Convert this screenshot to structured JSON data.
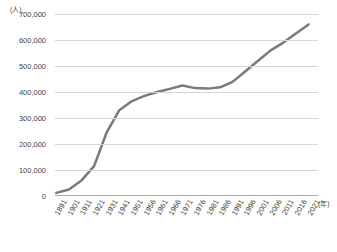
{
  "chart_data": {
    "type": "line",
    "title": "",
    "xlabel": "(年)",
    "ylabel": "(人)",
    "ylim": [
      0,
      700000
    ],
    "ytick_labels": [
      "700,000",
      "600,000",
      "500,000",
      "400,000",
      "300,000",
      "200,000",
      "100,000",
      "0"
    ],
    "ytick_values": [
      700000,
      600000,
      500000,
      400000,
      300000,
      200000,
      100000,
      0
    ],
    "grid": true,
    "legend": "none",
    "line_color": "#7a7a78",
    "line_width": 2.5,
    "categories": [
      "1891",
      "1901",
      "1911",
      "1921",
      "1931",
      "1941",
      "1951",
      "1956",
      "1961",
      "1966",
      "1971",
      "1976",
      "1981",
      "1986",
      "1991",
      "1996",
      "2001",
      "2006",
      "2011",
      "2016",
      "2021"
    ],
    "values": [
      12000,
      25000,
      60000,
      115000,
      245000,
      330000,
      365000,
      385000,
      400000,
      412000,
      425000,
      415000,
      413000,
      418000,
      440000,
      480000,
      520000,
      560000,
      590000,
      625000,
      660000
    ],
    "series": [
      {
        "name": "人口",
        "values": [
          12000,
          25000,
          60000,
          115000,
          245000,
          330000,
          365000,
          385000,
          400000,
          412000,
          425000,
          415000,
          413000,
          418000,
          440000,
          480000,
          520000,
          560000,
          590000,
          625000,
          660000
        ]
      }
    ]
  }
}
